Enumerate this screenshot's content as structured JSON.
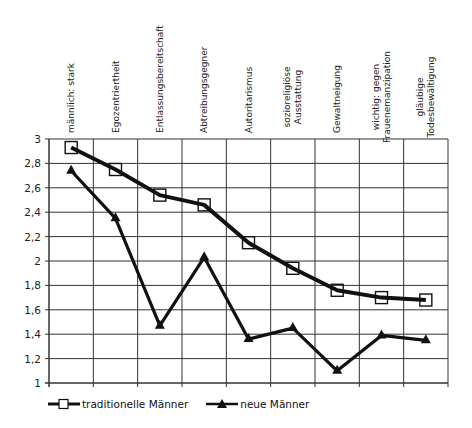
{
  "chart_data": {
    "type": "line",
    "title": "",
    "xlabel": "",
    "ylabel": "",
    "categories": [
      "männlich: stark",
      "Egozentriertheit",
      "Entlassungsbereitschaft",
      "Abtreibungsgegner",
      "Autoritarismus",
      "sozioreligiöse Ausstattung",
      "Gewaltneigung",
      "wichtig: gegen Frauenemanzipation",
      "gläubige Todesbewältigung"
    ],
    "category_lines": [
      [
        "männlich: stark"
      ],
      [
        "Egozentriertheit"
      ],
      [
        "Entlassungsbereitschaft"
      ],
      [
        "Abtreibungsgegner"
      ],
      [
        "Autoritarismus"
      ],
      [
        "sozioreligiöse",
        "Ausstattung"
      ],
      [
        "Gewaltneigung"
      ],
      [
        "wichtig: gegen",
        "Frauenemanzipation"
      ],
      [
        "gläubige",
        "Todesbewältigung"
      ]
    ],
    "series": [
      {
        "name": "traditionelle Männer",
        "marker": "square",
        "values": [
          2.93,
          2.75,
          2.54,
          2.46,
          2.15,
          1.94,
          1.76,
          1.7,
          1.68
        ]
      },
      {
        "name": "neue Männer",
        "marker": "triangle",
        "values": [
          2.74,
          2.35,
          1.47,
          2.03,
          1.36,
          1.45,
          1.1,
          1.39,
          1.35
        ]
      }
    ],
    "ylim": [
      1,
      3
    ],
    "yticks": [
      "3",
      "2,8",
      "2,6",
      "2,4",
      "2,2",
      "2",
      "1,8",
      "1,6",
      "1,4",
      "1,2",
      "1"
    ],
    "grid": true,
    "legend_position": "bottom",
    "colors": {
      "line": "#111111",
      "grid": "#333333",
      "background": "#ffffff"
    }
  },
  "legend": {
    "items": [
      {
        "label": "traditionelle Männer",
        "icon": "square-marker-icon"
      },
      {
        "label": "neue Männer",
        "icon": "triangle-marker-icon"
      }
    ]
  }
}
